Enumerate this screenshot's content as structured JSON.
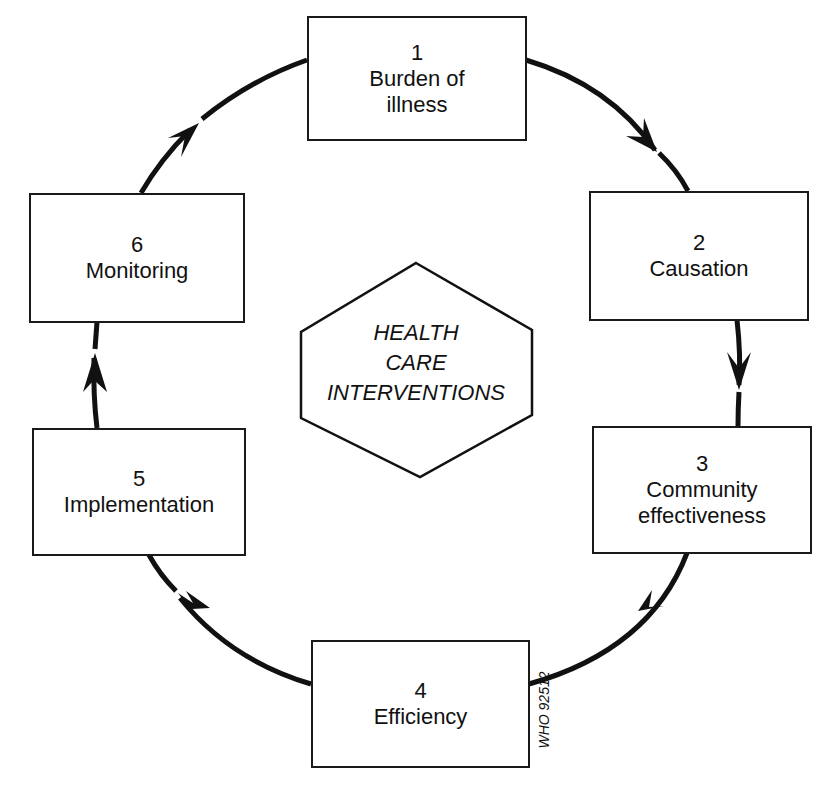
{
  "diagram": {
    "center": {
      "shape": "hexagon",
      "lines": [
        "HEALTH",
        "CARE",
        "INTERVENTIONS"
      ]
    },
    "steps": [
      {
        "number": "1",
        "label": "Burden of\nillness"
      },
      {
        "number": "2",
        "label": "Causation"
      },
      {
        "number": "3",
        "label": "Community\neffectiveness"
      },
      {
        "number": "4",
        "label": "Efficiency"
      },
      {
        "number": "5",
        "label": "Implementation"
      },
      {
        "number": "6",
        "label": "Monitoring"
      }
    ],
    "flow": "clockwise cycle 1 → 2 → 3 → 4 → 5 → 6 → 1",
    "code": "WHO 92512",
    "colors": {
      "stroke": "#111111",
      "background": "#ffffff"
    }
  }
}
